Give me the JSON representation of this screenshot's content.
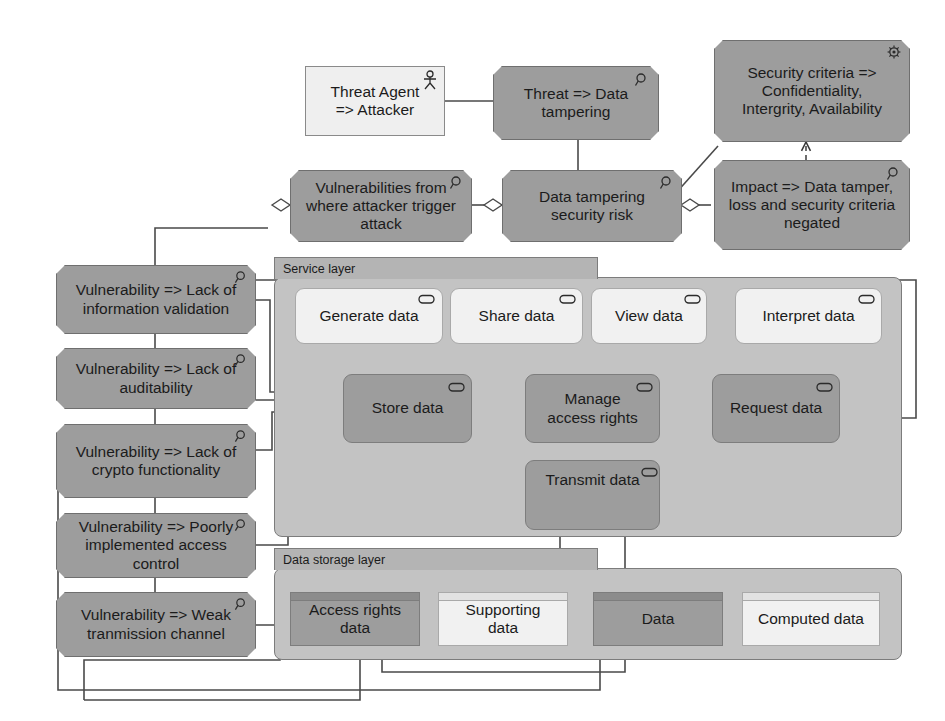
{
  "diagram": {
    "type": "ArchiMate risk / layered application model",
    "palette": {
      "dark_fill": "#9d9d9d",
      "light_fill": "#f1f1f1",
      "group_fill": "#c3c3c3",
      "group_tab_fill": "#b4b4b4",
      "stroke": "#555555",
      "text": "#1b1b1b",
      "page_background": "#ffffff"
    }
  },
  "risk_nodes": {
    "threat_agent": {
      "label": "Threat Agent => Attacker",
      "icon": "business-actor-icon",
      "style": "light-rectangle"
    },
    "threat": {
      "label": "Threat => Data tampering",
      "icon": "magnifier-icon",
      "style": "dark-octagon"
    },
    "security_criteria": {
      "label": "Security criteria => Confidentiality, Intergrity, Availability",
      "icon": "meaning-icon",
      "style": "dark-octagon"
    },
    "impact": {
      "label": "Impact => Data tamper, loss and security criteria negated",
      "icon": "magnifier-icon",
      "style": "dark-octagon"
    },
    "vulnerabilities_source": {
      "label": "Vulnerabilities from where attacker trigger attack",
      "icon": "magnifier-icon",
      "style": "dark-octagon"
    },
    "security_risk": {
      "label": "Data tampering security risk",
      "icon": "magnifier-icon",
      "style": "dark-octagon"
    }
  },
  "vulnerabilities": [
    {
      "label": "Vulnerability => Lack of information validation",
      "icon": "magnifier-icon"
    },
    {
      "label": "Vulnerability => Lack of auditability",
      "icon": "magnifier-icon"
    },
    {
      "label": "Vulnerability => Lack of crypto functionality",
      "icon": "magnifier-icon"
    },
    {
      "label": "Vulnerability => Poorly implemented access control",
      "icon": "magnifier-icon"
    },
    {
      "label": "Vulnerability => Weak tranmission channel",
      "icon": "magnifier-icon"
    }
  ],
  "service_layer": {
    "title": "Service layer",
    "services_light": [
      {
        "label": "Generate data",
        "icon": "application-service-icon"
      },
      {
        "label": "Share data",
        "icon": "application-service-icon"
      },
      {
        "label": "View data",
        "icon": "application-service-icon"
      },
      {
        "label": "Interpret data",
        "icon": "application-service-icon"
      }
    ],
    "services_dark": [
      {
        "label": "Store data",
        "icon": "application-service-icon"
      },
      {
        "label": "Manage access rights",
        "icon": "application-service-icon"
      },
      {
        "label": "Request data",
        "icon": "application-service-icon"
      },
      {
        "label": "Transmit data",
        "icon": "application-service-icon"
      }
    ]
  },
  "data_storage_layer": {
    "title": "Data storage layer",
    "objects": [
      {
        "label": "Access rights data",
        "icon": "data-object-icon",
        "shade": "dark"
      },
      {
        "label": "Supporting data",
        "icon": "data-object-icon",
        "shade": "light"
      },
      {
        "label": "Data",
        "icon": "data-object-icon",
        "shade": "dark"
      },
      {
        "label": "Computed data",
        "icon": "data-object-icon",
        "shade": "light"
      }
    ]
  }
}
